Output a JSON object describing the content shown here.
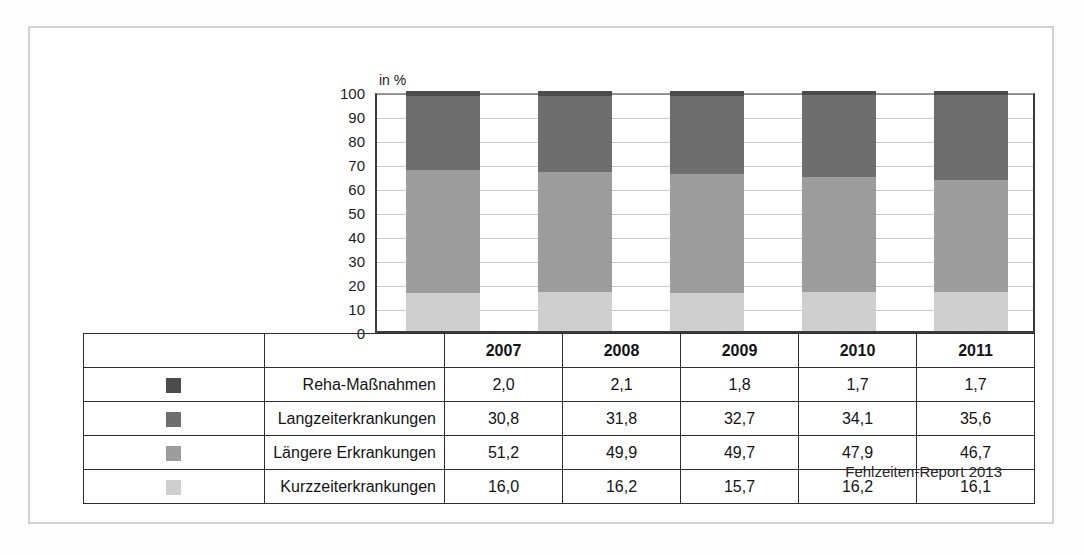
{
  "chart_data": {
    "type": "bar",
    "subtype": "stacked-percentage",
    "title": "",
    "xlabel": "",
    "ylabel": "",
    "unit_label": "in %",
    "categories": [
      "2007",
      "2008",
      "2009",
      "2010",
      "2011"
    ],
    "ylim": [
      0,
      100
    ],
    "yticks": [
      100,
      90,
      80,
      70,
      60,
      50,
      40,
      30,
      20,
      10,
      0
    ],
    "grid": true,
    "legend_position": "table-left",
    "stack_order_top_to_bottom": [
      "Reha-Maßnahmen",
      "Langzeiterkrankungen",
      "Längere Erkrankungen",
      "Kurzzeiterkrankungen"
    ],
    "series": [
      {
        "name": "Reha-Maßnahmen",
        "color": "#4c4c4c",
        "values": [
          2.0,
          2.1,
          1.8,
          1.7,
          1.7
        ],
        "display_values": [
          "2,0",
          "2,1",
          "1,8",
          "1,7",
          "1,7"
        ]
      },
      {
        "name": "Langzeiterkrankungen",
        "color": "#6e6e6e",
        "values": [
          30.8,
          31.8,
          32.7,
          34.1,
          35.6
        ],
        "display_values": [
          "30,8",
          "31,8",
          "32,7",
          "34,1",
          "35,6"
        ]
      },
      {
        "name": "Längere Erkrankungen",
        "color": "#9d9d9d",
        "values": [
          51.2,
          49.9,
          49.7,
          47.9,
          46.7
        ],
        "display_values": [
          "51,2",
          "49,9",
          "49,7",
          "47,9",
          "46,7"
        ]
      },
      {
        "name": "Kurzzeiterkrankungen",
        "color": "#cfcfcf",
        "values": [
          16.0,
          16.2,
          15.7,
          16.2,
          16.1
        ],
        "display_values": [
          "16,0",
          "16,2",
          "15,7",
          "16,2",
          "16,1"
        ]
      }
    ]
  },
  "table": {
    "year_headers": [
      "2007",
      "2008",
      "2009",
      "2010",
      "2011"
    ],
    "rows": [
      {
        "label": "Reha-Maßnahmen",
        "swatch_color": "#4c4c4c",
        "values": [
          "2,0",
          "2,1",
          "1,8",
          "1,7",
          "1,7"
        ]
      },
      {
        "label": "Langzeiterkrankungen",
        "swatch_color": "#6e6e6e",
        "values": [
          "30,8",
          "31,8",
          "32,7",
          "34,1",
          "35,6"
        ]
      },
      {
        "label": "Längere Erkrankungen",
        "swatch_color": "#9d9d9d",
        "values": [
          "51,2",
          "49,9",
          "49,7",
          "47,9",
          "46,7"
        ]
      },
      {
        "label": "Kurzzeiterkrankungen",
        "swatch_color": "#cfcfcf",
        "values": [
          "16,0",
          "16,2",
          "15,7",
          "16,2",
          "16,1"
        ]
      }
    ]
  },
  "footer": {
    "source": "Fehlzeiten-Report 2013"
  }
}
